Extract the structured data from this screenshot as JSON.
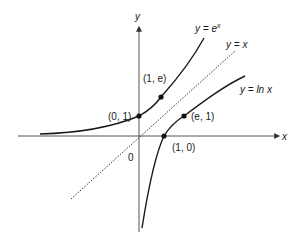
{
  "diagram": {
    "axes": {
      "x_label": "x",
      "y_label": "y",
      "origin_label": "0"
    },
    "curves": [
      {
        "id": "exp",
        "label_prefix": "y = e",
        "label_sup": "x",
        "full_label": "y = e^x"
      },
      {
        "id": "identity",
        "label": "y = x",
        "style": "dotted"
      },
      {
        "id": "log",
        "label": "y = ln x"
      }
    ],
    "points": [
      {
        "label": "(0, 1)",
        "on": "y = e^x"
      },
      {
        "label": "(1, e)",
        "on": "y = e^x"
      },
      {
        "label": "(1, 0)",
        "on": "y = ln x"
      },
      {
        "label": "(e, 1)",
        "on": "y = ln x"
      }
    ],
    "colors": {
      "stroke": "#1a1a1a",
      "axis": "#444444",
      "background": "#ffffff"
    }
  }
}
